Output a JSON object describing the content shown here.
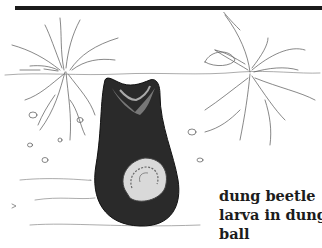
{
  "figure": {
    "caption_lines": [
      "dung beetle",
      "larva in dung",
      "ball"
    ],
    "colors": {
      "ink": "#1a1a1a",
      "background": "#ffffff",
      "caption": "#1c1c1c"
    }
  }
}
